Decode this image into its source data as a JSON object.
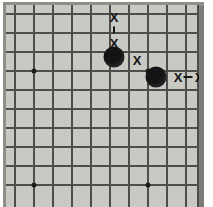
{
  "figure": {
    "board_colors": {
      "surface": "#c9c9c4",
      "frame": "#8f8f8a",
      "line": "#4d4d4d",
      "stone_black": "#141414",
      "mark": "#151515",
      "page_background": "#ffffff"
    },
    "geometry": {
      "origin_x": 9,
      "origin_y": 9,
      "spacing": 19,
      "columns": 11,
      "rows": 10
    }
  },
  "board": {
    "vertical_lines": [
      9,
      28,
      47,
      66,
      85,
      104,
      123,
      142,
      161,
      180,
      192
    ],
    "horizontal_lines": [
      9,
      28,
      47,
      66,
      85,
      104,
      123,
      142,
      161,
      180
    ],
    "star_points": [
      {
        "name": "hoshi-left-upper",
        "x": 28,
        "y": 66
      },
      {
        "name": "hoshi-right-upper",
        "x": 142,
        "y": 66
      },
      {
        "name": "hoshi-left-lower",
        "x": 28,
        "y": 180
      },
      {
        "name": "hoshi-right-lower",
        "x": 142,
        "y": 180
      }
    ],
    "stones": [
      {
        "name": "black-stone-1",
        "color": "black",
        "x": 108,
        "y": 52
      },
      {
        "name": "black-stone-2",
        "color": "black",
        "x": 150,
        "y": 72
      }
    ],
    "marks": [
      {
        "label": "X",
        "name": "mark-x-top-upper",
        "x": 108,
        "y": 12
      },
      {
        "label": "X",
        "name": "mark-x-top-lower",
        "x": 108,
        "y": 38
      },
      {
        "label": "X",
        "name": "mark-x-right-of-stone-1",
        "x": 131,
        "y": 55
      },
      {
        "label": "X",
        "name": "mark-x-right-1",
        "x": 172,
        "y": 72
      },
      {
        "label": "X",
        "name": "mark-x-right-2",
        "x": 193,
        "y": 72
      }
    ],
    "connectors": [
      {
        "name": "connector-vertical-top",
        "orientation": "vertical",
        "x": 108,
        "y": 25
      },
      {
        "name": "connector-horizontal-right",
        "orientation": "horizontal",
        "x": 182,
        "y": 72
      }
    ]
  }
}
